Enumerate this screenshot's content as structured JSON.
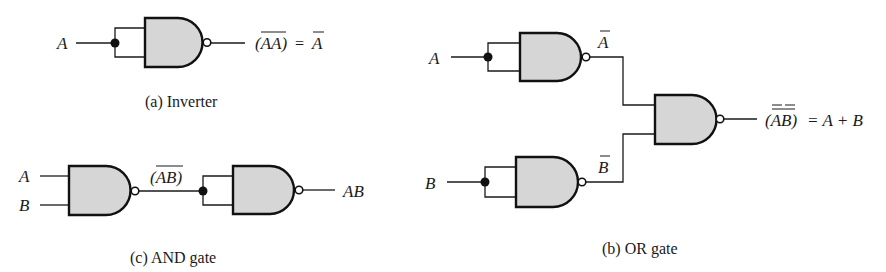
{
  "figure": {
    "colors": {
      "gate_fill": "#d6d6d6",
      "stroke": "#111111",
      "background": "#ffffff"
    },
    "inverter": {
      "caption": "(a) Inverter",
      "input_label": "A",
      "output_expr_lhs": "(AA)",
      "output_expr_eq": "=",
      "output_expr_rhs": "A",
      "overbars": [
        "AA",
        "A"
      ]
    },
    "and_gate": {
      "caption": "(c) AND gate",
      "inputs": [
        "A",
        "B"
      ],
      "intermediate_label": "(AB)",
      "intermediate_overbar": "AB",
      "output_label": "AB"
    },
    "or_gate": {
      "caption": "(b) OR gate",
      "inputs": [
        "A",
        "B"
      ],
      "intermediate_labels": [
        "A",
        "B"
      ],
      "intermediate_overbars": [
        "A",
        "B"
      ],
      "output_expr_lhs": "(AB)",
      "output_expr_eq": "= A + B",
      "output_overbars": [
        "A",
        "B",
        "AB"
      ]
    }
  }
}
